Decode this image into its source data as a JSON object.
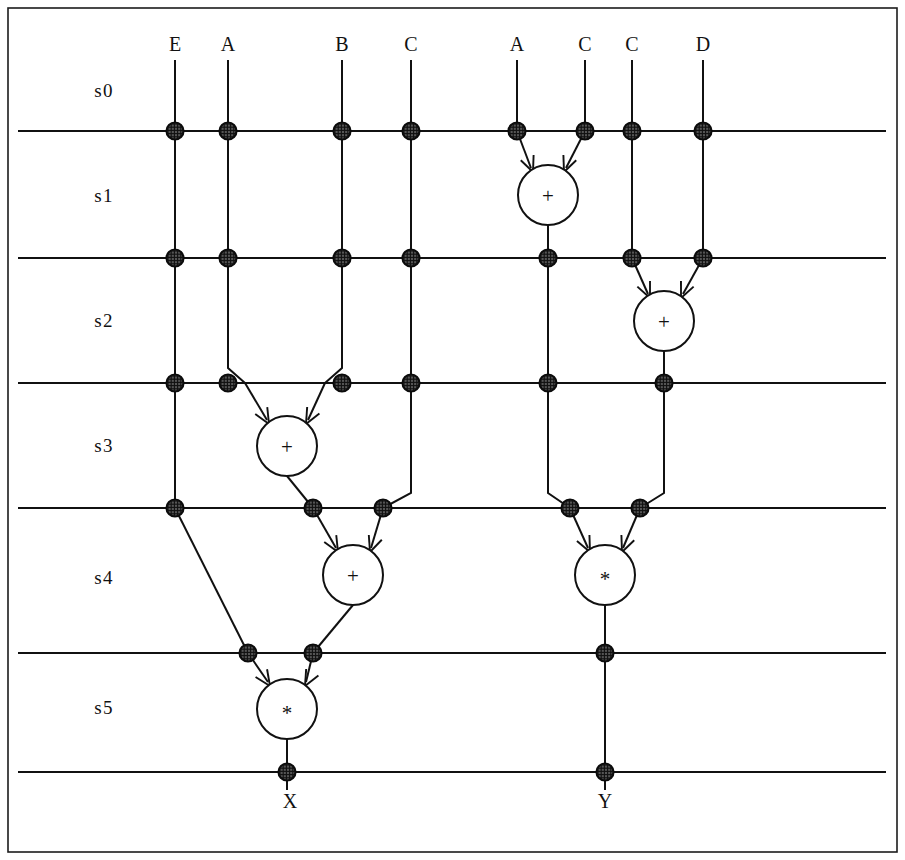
{
  "figure": {
    "kind": "scheduled-data-flow-graph",
    "frame": {
      "x": 8,
      "y": 8,
      "width": 889,
      "height": 844,
      "stroke": "#1c1c1c"
    },
    "colors": {
      "line": "#111111",
      "register_fill": "#555555",
      "register_stroke": "#0b0b0b",
      "operator_fill": "#ffffff",
      "background": "#ffffff"
    }
  },
  "stages": {
    "label_x": 104,
    "items": [
      {
        "name": "s0",
        "label": "s0",
        "y": 90
      },
      {
        "name": "s1",
        "label": "s1",
        "y": 195
      },
      {
        "name": "s2",
        "label": "s2",
        "y": 320
      },
      {
        "name": "s3",
        "label": "s3",
        "y": 445
      },
      {
        "name": "s4",
        "label": "s4",
        "y": 577
      },
      {
        "name": "s5",
        "label": "s5",
        "y": 707
      }
    ]
  },
  "stage_lines": [
    {
      "name": "boundary-s0-s1",
      "y": 131,
      "x1": 18,
      "x2": 886
    },
    {
      "name": "boundary-s1-s2",
      "y": 258,
      "x1": 18,
      "x2": 886
    },
    {
      "name": "boundary-s2-s3",
      "y": 383,
      "x1": 18,
      "x2": 886
    },
    {
      "name": "boundary-s3-s4",
      "y": 508,
      "x1": 18,
      "x2": 886
    },
    {
      "name": "boundary-s4-s5",
      "y": 653,
      "x1": 18,
      "x2": 886
    },
    {
      "name": "boundary-s5-out",
      "y": 772,
      "x1": 18,
      "x2": 886
    }
  ],
  "inputs": [
    {
      "name": "input-e",
      "label": "E",
      "x": 175,
      "y": 44
    },
    {
      "name": "input-a1",
      "label": "A",
      "x": 228,
      "y": 44
    },
    {
      "name": "input-b",
      "label": "B",
      "x": 342,
      "y": 44
    },
    {
      "name": "input-c1",
      "label": "C",
      "x": 411,
      "y": 44
    },
    {
      "name": "input-a2",
      "label": "A",
      "x": 517,
      "y": 44
    },
    {
      "name": "input-c2",
      "label": "C",
      "x": 585,
      "y": 44
    },
    {
      "name": "input-c3",
      "label": "C",
      "x": 632,
      "y": 44
    },
    {
      "name": "input-d",
      "label": "D",
      "x": 703,
      "y": 44
    }
  ],
  "outputs": [
    {
      "name": "output-x",
      "label": "X",
      "x": 290,
      "y": 801
    },
    {
      "name": "output-y",
      "label": "Y",
      "x": 605,
      "y": 801
    }
  ],
  "operators": [
    {
      "name": "op-add-s1",
      "glyph": "+",
      "type": "add",
      "x": 548,
      "y": 195,
      "r": 30
    },
    {
      "name": "op-add-s2",
      "glyph": "+",
      "type": "add",
      "x": 664,
      "y": 321,
      "r": 30
    },
    {
      "name": "op-add-s3",
      "glyph": "+",
      "type": "add",
      "x": 287,
      "y": 446,
      "r": 30
    },
    {
      "name": "op-add-s4",
      "glyph": "+",
      "type": "add",
      "x": 353,
      "y": 575,
      "r": 30
    },
    {
      "name": "op-mul-s4",
      "glyph": "*",
      "type": "multiply",
      "x": 605,
      "y": 575,
      "r": 30
    },
    {
      "name": "op-mul-s5",
      "glyph": "*",
      "type": "multiply",
      "x": 287,
      "y": 709,
      "r": 30
    }
  ],
  "registers": [
    {
      "name": "reg-e-s0",
      "x": 175,
      "y": 131
    },
    {
      "name": "reg-a1-s0",
      "x": 228,
      "y": 131
    },
    {
      "name": "reg-b-s0",
      "x": 342,
      "y": 131
    },
    {
      "name": "reg-c1-s0",
      "x": 411,
      "y": 131
    },
    {
      "name": "reg-a2-s0",
      "x": 517,
      "y": 131
    },
    {
      "name": "reg-c2-s0",
      "x": 585,
      "y": 131
    },
    {
      "name": "reg-c3-s0",
      "x": 632,
      "y": 131
    },
    {
      "name": "reg-d-s0",
      "x": 703,
      "y": 131
    },
    {
      "name": "reg-e-s1",
      "x": 175,
      "y": 258
    },
    {
      "name": "reg-a1-s1",
      "x": 228,
      "y": 258
    },
    {
      "name": "reg-b-s1",
      "x": 342,
      "y": 258
    },
    {
      "name": "reg-c1-s1",
      "x": 411,
      "y": 258
    },
    {
      "name": "reg-sum1-s1",
      "x": 548,
      "y": 258
    },
    {
      "name": "reg-c3-s1",
      "x": 632,
      "y": 258
    },
    {
      "name": "reg-d-s1",
      "x": 703,
      "y": 258
    },
    {
      "name": "reg-e-s2",
      "x": 175,
      "y": 383
    },
    {
      "name": "reg-a1-s2",
      "x": 228,
      "y": 383
    },
    {
      "name": "reg-b-s2",
      "x": 342,
      "y": 383
    },
    {
      "name": "reg-c1-s2",
      "x": 411,
      "y": 383
    },
    {
      "name": "reg-sum1-s2",
      "x": 548,
      "y": 383
    },
    {
      "name": "reg-sum2-s2",
      "x": 664,
      "y": 383
    },
    {
      "name": "reg-e-s3",
      "x": 175,
      "y": 508
    },
    {
      "name": "reg-sum3-s3",
      "x": 313,
      "y": 508
    },
    {
      "name": "reg-c1-s3",
      "x": 383,
      "y": 508
    },
    {
      "name": "reg-sum1-s3",
      "x": 570,
      "y": 508
    },
    {
      "name": "reg-sum2-s3",
      "x": 640,
      "y": 508
    },
    {
      "name": "reg-e-s4",
      "x": 248,
      "y": 653
    },
    {
      "name": "reg-sum4-s4",
      "x": 313,
      "y": 653
    },
    {
      "name": "reg-prod-s4",
      "x": 605,
      "y": 653
    },
    {
      "name": "reg-x-s5",
      "x": 287,
      "y": 772
    },
    {
      "name": "reg-y-s5",
      "x": 605,
      "y": 772
    }
  ],
  "wires": [
    {
      "name": "wire-e-in",
      "points": "175,60 175,131"
    },
    {
      "name": "wire-a1-in",
      "points": "228,60 228,131"
    },
    {
      "name": "wire-b-in",
      "points": "342,60 342,131"
    },
    {
      "name": "wire-c1-in",
      "points": "411,60 411,131"
    },
    {
      "name": "wire-a2-in",
      "points": "517,60 517,131"
    },
    {
      "name": "wire-c2-in",
      "points": "585,60 585,131"
    },
    {
      "name": "wire-c3-in",
      "points": "632,60 632,131"
    },
    {
      "name": "wire-d-in",
      "points": "703,60 703,131"
    },
    {
      "name": "wire-a2-to-add-s1",
      "points": "517,131 531,168"
    },
    {
      "name": "wire-c2-to-add-s1",
      "points": "585,131 566,168"
    },
    {
      "name": "wire-add-s1-out",
      "points": "548,225 548,258"
    },
    {
      "name": "wire-e-s0-s1",
      "points": "175,131 175,258"
    },
    {
      "name": "wire-a1-s0-s1",
      "points": "228,131 228,258"
    },
    {
      "name": "wire-b-s0-s1",
      "points": "342,131 342,258"
    },
    {
      "name": "wire-c1-s0-s1",
      "points": "411,131 411,258"
    },
    {
      "name": "wire-c3-s0-s1",
      "points": "632,131 632,258"
    },
    {
      "name": "wire-d-s0-s1",
      "points": "703,131 703,258"
    },
    {
      "name": "wire-c3-to-add-s2",
      "points": "632,258 648,294"
    },
    {
      "name": "wire-d-to-add-s2",
      "points": "703,258 683,294"
    },
    {
      "name": "wire-add-s2-out",
      "points": "664,351 664,383"
    },
    {
      "name": "wire-e-s1-s2",
      "points": "175,258 175,383"
    },
    {
      "name": "wire-a1-s1-s2",
      "points": "228,258 228,368 245,383"
    },
    {
      "name": "wire-b-s1-s2",
      "points": "342,258 342,368 325,383"
    },
    {
      "name": "wire-c1-s1-s2",
      "points": "411,258 411,383"
    },
    {
      "name": "wire-sum1-s1-s2",
      "points": "548,258 548,383"
    },
    {
      "name": "wire-a1-to-add-s3",
      "points": "245,383 267,420"
    },
    {
      "name": "wire-b-to-add-s3",
      "points": "325,383 308,420"
    },
    {
      "name": "wire-add-s3-out",
      "points": "287,476 313,508"
    },
    {
      "name": "wire-e-s2-s3",
      "points": "175,383 175,508"
    },
    {
      "name": "wire-c1-s2-s3",
      "points": "411,383 411,493 383,508"
    },
    {
      "name": "wire-sum1-s2-s3",
      "points": "548,383 548,493 570,508"
    },
    {
      "name": "wire-sum2-s2-s3",
      "points": "664,383 664,493 640,508"
    },
    {
      "name": "wire-sum3-to-add-s4",
      "points": "313,508 336,548"
    },
    {
      "name": "wire-c1-to-add-s4",
      "points": "383,508 371,548"
    },
    {
      "name": "wire-add-s4-out",
      "points": "353,605 313,653"
    },
    {
      "name": "wire-sum1-to-mul-s4",
      "points": "570,508 588,548"
    },
    {
      "name": "wire-sum2-to-mul-s4",
      "points": "640,508 623,548"
    },
    {
      "name": "wire-mul-s4-out",
      "points": "605,605 605,653"
    },
    {
      "name": "wire-e-s3-s4",
      "points": "175,508 248,653"
    },
    {
      "name": "wire-e-to-mul-s5",
      "points": "248,653 268,682"
    },
    {
      "name": "wire-sum4-to-mul-s5",
      "points": "313,653 306,682"
    },
    {
      "name": "wire-mul-s5-out",
      "points": "287,739 287,772"
    },
    {
      "name": "wire-prod-s4-s5",
      "points": "605,653 605,772"
    },
    {
      "name": "wire-x-out",
      "points": "287,772 287,790"
    },
    {
      "name": "wire-y-out",
      "points": "605,772 605,790"
    }
  ],
  "arrowheads": [
    {
      "name": "arrowhead-add-s1-left",
      "x": 533,
      "y": 172,
      "angle": 68
    },
    {
      "name": "arrowhead-add-s1-right",
      "x": 564,
      "y": 172,
      "angle": 112
    },
    {
      "name": "arrowhead-add-s2-left",
      "x": 650,
      "y": 298,
      "angle": 66
    },
    {
      "name": "arrowhead-add-s2-right",
      "x": 681,
      "y": 298,
      "angle": 114
    },
    {
      "name": "arrowhead-add-s3-left",
      "x": 269,
      "y": 424,
      "angle": 60
    },
    {
      "name": "arrowhead-add-s3-right",
      "x": 306,
      "y": 424,
      "angle": 118
    },
    {
      "name": "arrowhead-add-s4-left",
      "x": 338,
      "y": 552,
      "angle": 60
    },
    {
      "name": "arrowhead-add-s4-right",
      "x": 370,
      "y": 552,
      "angle": 110
    },
    {
      "name": "arrowhead-mul-s4-left",
      "x": 590,
      "y": 552,
      "angle": 64
    },
    {
      "name": "arrowhead-mul-s4-right",
      "x": 622,
      "y": 552,
      "angle": 112
    },
    {
      "name": "arrowhead-mul-s5-left",
      "x": 270,
      "y": 686,
      "angle": 56
    },
    {
      "name": "arrowhead-mul-s5-right",
      "x": 305,
      "y": 686,
      "angle": 118
    }
  ]
}
